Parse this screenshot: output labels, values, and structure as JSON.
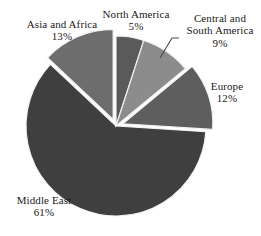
{
  "chart_data": {
    "type": "pie",
    "title": "",
    "subtitle": "",
    "xlabel": "",
    "ylabel": "",
    "legend_position": "none",
    "grid": false,
    "labels_outside": true,
    "start_angle_deg": 0,
    "direction": "clockwise",
    "categories": [
      "North America",
      "Central and South America",
      "Europe",
      "Middle East",
      "Asia and Africa"
    ],
    "values": [
      5,
      9,
      12,
      61,
      13
    ],
    "unit": "%",
    "slices": [
      {
        "label": "North America",
        "label_line1": "North America",
        "label_line2": "",
        "value": 5,
        "value_text": "5%",
        "color": "#5a5a5a",
        "exploded": false,
        "leader_line": false
      },
      {
        "label": "Central and South America",
        "label_line1": "Central and",
        "label_line2": "South America",
        "value": 9,
        "value_text": "9%",
        "color": "#8c8c8c",
        "exploded": false,
        "leader_line": true
      },
      {
        "label": "Europe",
        "label_line1": "Europe",
        "label_line2": "",
        "value": 12,
        "value_text": "12%",
        "color": "#5e5e5e",
        "exploded": true,
        "leader_line": false
      },
      {
        "label": "Middle East",
        "label_line1": "Middle East",
        "label_line2": "",
        "value": 61,
        "value_text": "61%",
        "color": "#3f3f3f",
        "exploded": false,
        "leader_line": false
      },
      {
        "label": "Asia and Africa",
        "label_line1": "Asia and Africa",
        "label_line2": "",
        "value": 13,
        "value_text": "13%",
        "color": "#6d6d6d",
        "exploded": true,
        "leader_line": false
      }
    ],
    "colors": {
      "background": "#ffffff",
      "slice_separator": "#f2f2f2",
      "text": "#1a1a1a"
    }
  }
}
